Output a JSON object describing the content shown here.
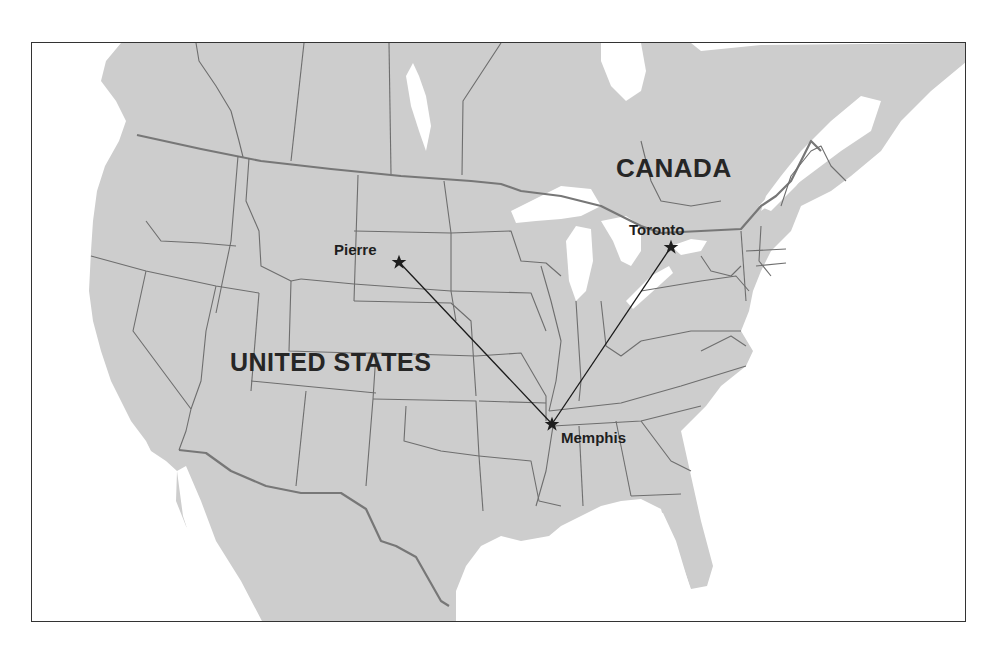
{
  "map": {
    "country_labels": [
      {
        "id": "canada",
        "text": "CANADA"
      },
      {
        "id": "united-states",
        "text": "UNITED STATES"
      }
    ],
    "cities": [
      {
        "id": "pierre",
        "name": "Pierre",
        "marker": "star-icon"
      },
      {
        "id": "toronto",
        "name": "Toronto",
        "marker": "star-icon"
      },
      {
        "id": "memphis",
        "name": "Memphis",
        "marker": "star-icon"
      }
    ],
    "routes": [
      {
        "from": "Pierre",
        "to": "Memphis"
      },
      {
        "from": "Toronto",
        "to": "Memphis"
      }
    ],
    "colors": {
      "land": "#cdcdcd",
      "water": "#ffffff",
      "borders": "#6e6e6e",
      "route_line": "#1a1a1a",
      "label_text": "#262626"
    }
  }
}
